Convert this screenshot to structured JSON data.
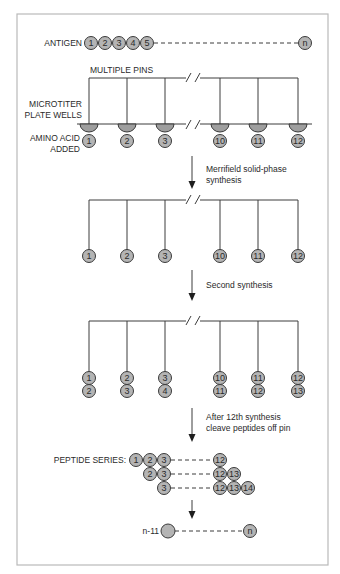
{
  "figure": {
    "labels": {
      "antigen": "ANTIGEN",
      "multiple_pins": "MULTIPLE PINS",
      "microtiter_line1": "MICROTITER",
      "microtiter_line2": "PLATE WELLS",
      "amino_acid_line1": "AMINO ACID",
      "amino_acid_line2": "ADDED",
      "peptide_series": "PEPTIDE SERIES:",
      "n_minus_11": "n-11"
    },
    "steps": {
      "step1_line1": "Merrifield solid-phase",
      "step1_line2": "synthesis",
      "step2": "Second synthesis",
      "step3_line1": "After 12th synthesis",
      "step3_line2": "cleave peptides off pin"
    },
    "antigen_residues": [
      "1",
      "2",
      "3",
      "4",
      "5"
    ],
    "antigen_end": "n",
    "pins": [
      "1",
      "2",
      "3",
      "10",
      "11",
      "12"
    ],
    "second_residues": [
      "2",
      "3",
      "4",
      "11",
      "12",
      "13"
    ],
    "peptide_rows": [
      {
        "start": [
          "1",
          "2",
          "3"
        ],
        "end": [
          "12"
        ]
      },
      {
        "start": [
          "2",
          "3"
        ],
        "end": [
          "12",
          "13"
        ]
      },
      {
        "start": [
          "3"
        ],
        "end": [
          "12",
          "13",
          "14"
        ]
      }
    ],
    "final_end": "n",
    "colors": {
      "ball_fill": "#b4b4b4",
      "well_fill": "#9e9e9e",
      "line": "#3c3c3c",
      "frame": "#b9b9b9"
    }
  }
}
